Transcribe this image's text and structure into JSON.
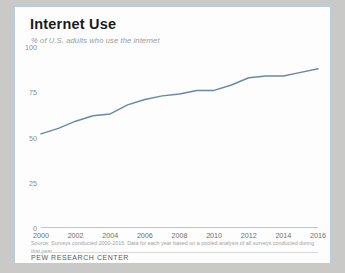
{
  "figure": {
    "title": "Internet Use",
    "subtitle": "% of U.S. adults who use the internet",
    "source": "Source: Surveys conducted 2000-2016. Data for each year based on a pooled analysis of all surveys conducted during that year.",
    "brand": "PEW RESEARCH CENTER",
    "border_color": "#b9cbe0",
    "background_color": "#fdfdfd",
    "page_background": "#c9c9c7"
  },
  "chart_data": {
    "type": "line",
    "title": "Internet Use",
    "subtitle": "% of U.S. adults who use the internet",
    "xlabel": "",
    "ylabel": "",
    "ylim": [
      0,
      100
    ],
    "yticks": [
      0,
      25,
      50,
      75,
      100
    ],
    "ytick_labels": [
      "0",
      "25",
      "50",
      "75",
      "100"
    ],
    "xlim": [
      2000,
      2016
    ],
    "xticks": [
      2000,
      2002,
      2004,
      2006,
      2008,
      2010,
      2012,
      2014,
      2016
    ],
    "xtick_labels": [
      "2000",
      "2002",
      "2004",
      "2006",
      "2008",
      "2010",
      "2012",
      "2014",
      "2016"
    ],
    "grid": false,
    "legend": false,
    "line_color": "#6b86ab",
    "line_width": 1.4,
    "series": [
      {
        "name": "% of U.S. adults who use the internet",
        "x": [
          2000,
          2001,
          2002,
          2003,
          2004,
          2005,
          2006,
          2007,
          2008,
          2009,
          2010,
          2011,
          2012,
          2013,
          2014,
          2015,
          2016
        ],
        "values": [
          52,
          55,
          59,
          62,
          63,
          68,
          71,
          73,
          74,
          76,
          76,
          79,
          83,
          84,
          84,
          86,
          88
        ]
      }
    ]
  }
}
